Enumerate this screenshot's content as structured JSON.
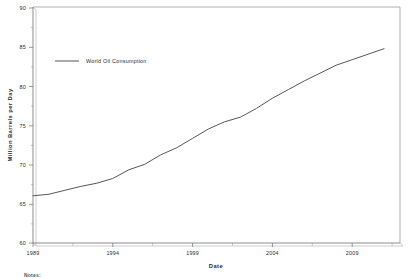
{
  "chart_data": {
    "type": "line",
    "title": "",
    "xlabel": "Date",
    "ylabel": "Million Barrels per Day",
    "xlim": [
      1989,
      2012
    ],
    "ylim": [
      60,
      90
    ],
    "grid": false,
    "legend_position": "inside-upper-left",
    "x_tick_labels": [
      "1989",
      "1994",
      "1999",
      "2004",
      "2009"
    ],
    "x_tick_values": [
      1989,
      1994,
      1999,
      2004,
      2009
    ],
    "x_minor_tick_values": [
      1990,
      1991,
      1992,
      1993,
      1995,
      1996,
      1997,
      1998,
      2000,
      2001,
      2002,
      2003,
      2005,
      2006,
      2007,
      2008,
      2010,
      2011
    ],
    "y_tick_labels": [
      "60",
      "65",
      "70",
      "75",
      "80",
      "85",
      "90"
    ],
    "y_tick_values": [
      60,
      65,
      70,
      75,
      80,
      85,
      90
    ],
    "y_minor_tick_values": [
      61,
      62,
      63,
      64,
      66,
      67,
      68,
      69,
      71,
      72,
      73,
      74,
      76,
      77,
      78,
      79,
      81,
      82,
      83,
      84,
      86,
      87,
      88,
      89
    ],
    "series": [
      {
        "name": "World Oil Consumption",
        "color": "#4d4d55",
        "x": [
          1989,
          1990,
          1991,
          1992,
          1993,
          1994,
          1995,
          1996,
          1997,
          1998,
          1999,
          2000,
          2001,
          2002,
          2003,
          2004,
          2005,
          2006,
          2007,
          2008,
          2009,
          2010,
          2011
        ],
        "values": [
          66.0,
          66.2,
          66.7,
          67.2,
          67.6,
          68.2,
          69.3,
          70.0,
          71.2,
          72.1,
          73.3,
          74.5,
          75.4,
          76.0,
          77.1,
          78.4,
          79.5,
          80.6,
          81.6,
          82.6,
          83.3,
          84.0,
          84.7
        ]
      }
    ],
    "legend": [
      {
        "label": "World Oil Consumption",
        "color": "#4d4d55"
      }
    ]
  },
  "footnote": {
    "text": "Notes:"
  }
}
